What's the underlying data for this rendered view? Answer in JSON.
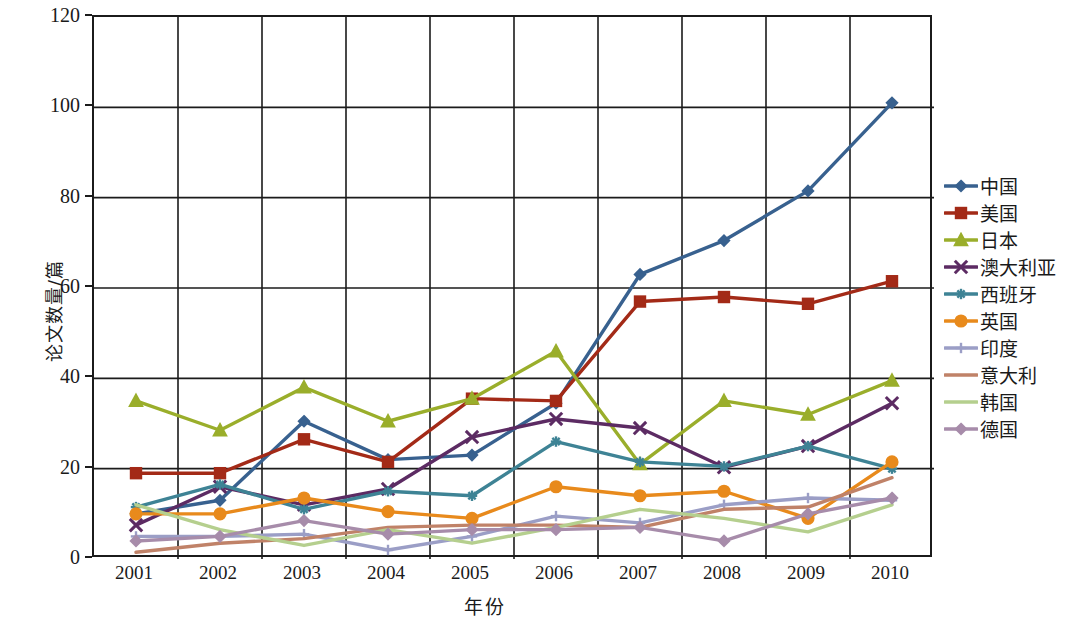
{
  "chart_data": {
    "type": "line",
    "title": "",
    "xlabel": "年份",
    "ylabel": "论文数量/篇",
    "categories": [
      "2001",
      "2002",
      "2003",
      "2004",
      "2005",
      "2006",
      "2007",
      "2008",
      "2009",
      "2010"
    ],
    "ylim": [
      0,
      120
    ],
    "yticks": [
      0,
      20,
      40,
      60,
      80,
      100,
      120
    ],
    "grid": true,
    "legend_position": "right",
    "series": [
      {
        "name": "中国",
        "color": "#38618f",
        "marker": "diamond",
        "values": [
          10,
          13,
          30.5,
          22,
          23,
          34.5,
          63,
          70.5,
          81.5,
          101
        ]
      },
      {
        "name": "美国",
        "color": "#a32a17",
        "marker": "square",
        "values": [
          19,
          19,
          26.5,
          21.5,
          35.5,
          35,
          57,
          58,
          56.5,
          61.5
        ]
      },
      {
        "name": "日本",
        "color": "#9aae2b",
        "marker": "triangle",
        "values": [
          35,
          28.5,
          38,
          30.5,
          35.5,
          46,
          21,
          35,
          32,
          39.5
        ]
      },
      {
        "name": "澳大利亚",
        "color": "#5c2b63",
        "marker": "cross",
        "values": [
          7.5,
          16,
          12,
          15.5,
          27,
          31,
          29,
          20.3,
          25,
          34.5
        ]
      },
      {
        "name": "西班牙",
        "color": "#3e8395",
        "marker": "star",
        "values": [
          11.5,
          16.5,
          11,
          15,
          14,
          26,
          21.5,
          20.5,
          25,
          20
        ]
      },
      {
        "name": "英国",
        "color": "#e88a1c",
        "marker": "circle",
        "values": [
          10,
          10,
          13.5,
          10.5,
          9,
          16,
          14,
          15,
          9,
          21.5
        ]
      },
      {
        "name": "印度",
        "color": "#9b9ec6",
        "marker": "plus",
        "values": [
          5,
          5,
          5.5,
          2,
          5,
          9.5,
          8,
          12,
          13.5,
          13
        ]
      },
      {
        "name": "意大利",
        "color": "#c08268",
        "marker": "line",
        "values": [
          1.5,
          3.5,
          4.5,
          7,
          7.5,
          7.5,
          7,
          11,
          11.5,
          18
        ]
      },
      {
        "name": "韩国",
        "color": "#b5cf8e",
        "marker": "line",
        "values": [
          12,
          6.5,
          3,
          6.5,
          3.5,
          7,
          11,
          9,
          6,
          12
        ]
      },
      {
        "name": "德国",
        "color": "#a78caa",
        "marker": "diamond",
        "values": [
          4,
          5,
          8.5,
          5.5,
          6.5,
          6.5,
          7,
          4,
          10,
          13.5
        ]
      }
    ]
  },
  "axes": {
    "y_tick_labels": [
      "120",
      "100",
      "80",
      "60",
      "40",
      "20",
      "0"
    ],
    "x_tick_labels": [
      "2001",
      "2002",
      "2003",
      "2004",
      "2005",
      "2006",
      "2007",
      "2008",
      "2009",
      "2010"
    ],
    "ylabel": "论文数量/篇",
    "xlabel": "年份"
  }
}
